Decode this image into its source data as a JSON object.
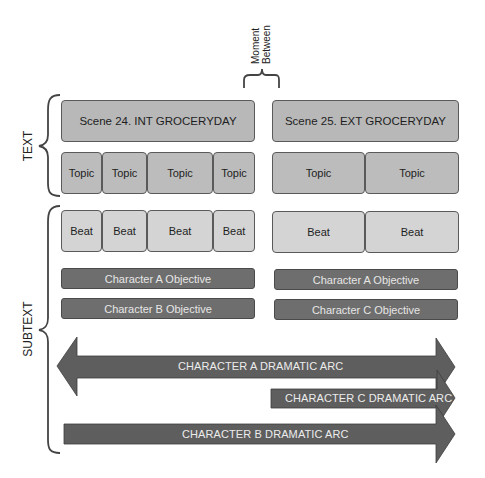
{
  "labels": {
    "text": "TEXT",
    "subtext": "SUBTEXT",
    "moment_between_line1": "Moment",
    "moment_between_line2": "Between"
  },
  "scenes": [
    {
      "title": "Scene 24. INT GROCERYDAY",
      "topics": [
        "Topic",
        "Topic",
        "Topic",
        "Topic"
      ],
      "beats": [
        "Beat",
        "Beat",
        "Beat",
        "Beat"
      ],
      "objectives": [
        "Character A Objective",
        "Character B Objective"
      ]
    },
    {
      "title": "Scene 25. EXT GROCERYDAY",
      "topics": [
        "Topic",
        "Topic"
      ],
      "beats": [
        "Beat",
        "Beat"
      ],
      "objectives": [
        "Character A Objective",
        "Character C Objective"
      ]
    }
  ],
  "arcs": [
    {
      "label": "CHARACTER A DRAMATIC ARC",
      "direction": "both"
    },
    {
      "label": "CHARACTER C DRAMATIC ARC",
      "direction": "right"
    },
    {
      "label": "CHARACTER B DRAMATIC ARC",
      "direction": "right"
    }
  ],
  "colors": {
    "scene_fill": "#b8b8b8",
    "topic_fill": "#bcbcbc",
    "beat_fill": "#d4d4d4",
    "objective_fill": "#6e6e6e",
    "arc_fill": "#5e5e5e"
  }
}
